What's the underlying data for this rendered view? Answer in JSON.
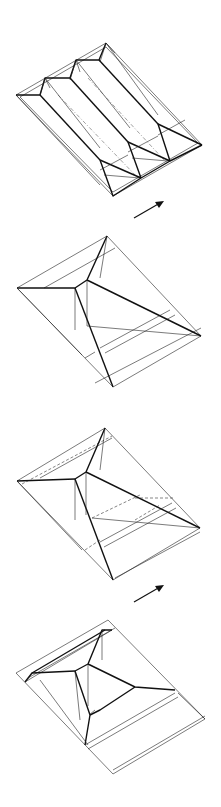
{
  "diagram": {
    "type": "origami folding sequence",
    "steps": [
      {
        "id": 1,
        "description": "pleated sheet with three parallel ridges and pointed ends"
      },
      {
        "id": 2,
        "description": "collapsed pyramid form with central node"
      },
      {
        "id": 3,
        "description": "pyramid form with dashed hidden fold lines"
      },
      {
        "id": 4,
        "description": "flattened base with raised central structure"
      }
    ],
    "arrows": [
      {
        "id": "arrow-1",
        "between": "step 1 to step 2"
      },
      {
        "id": "arrow-2",
        "between": "step 3 to step 4"
      }
    ],
    "colors": {
      "line": "#111111",
      "background": "#ffffff"
    }
  }
}
